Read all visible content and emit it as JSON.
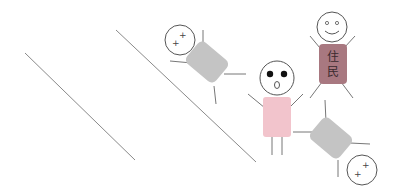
{
  "scene": {
    "description": "Stick-figure illustration: two stick figures sliding/falling down diagonal slopes, a surprised pink figure, and a smiling resident figure",
    "colors": {
      "background": "#ffffff",
      "line": "#8a8a8a",
      "outline": "#555555",
      "fallen_body": "#c4c4c4",
      "surprised_body": "#f2c4cc",
      "resident_body": "#a87880"
    },
    "slopes": [
      {
        "x1": 25,
        "y1": 53,
        "x2": 135,
        "y2": 160
      },
      {
        "x1": 116,
        "y1": 30,
        "x2": 256,
        "y2": 162
      }
    ],
    "figures": [
      {
        "id": "fallen-top",
        "state": "dizzy"
      },
      {
        "id": "surprised",
        "state": "shocked"
      },
      {
        "id": "resident",
        "state": "smiling",
        "label": "住民"
      },
      {
        "id": "fallen-bottom",
        "state": "dizzy"
      }
    ],
    "resident_label_line1": "住",
    "resident_label_line2": "民"
  }
}
